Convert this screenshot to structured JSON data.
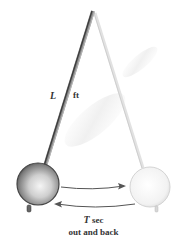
{
  "diagram": {
    "length_label": {
      "symbol": "L",
      "unit": "ft"
    },
    "period_label": {
      "symbol": "T",
      "unit": "sec",
      "description": "out and back"
    },
    "arrows": [
      {
        "direction": "right",
        "from": "left-bob",
        "to": "right-bob"
      },
      {
        "direction": "left",
        "from": "right-bob",
        "to": "left-bob"
      }
    ],
    "colors": {
      "rod_dark": "#555555",
      "rod_faded": "#dddddd",
      "bob_dark": "#7a7a7a",
      "bob_faded": "#eeeeee",
      "arrow": "#555555",
      "text": "#333333"
    }
  }
}
